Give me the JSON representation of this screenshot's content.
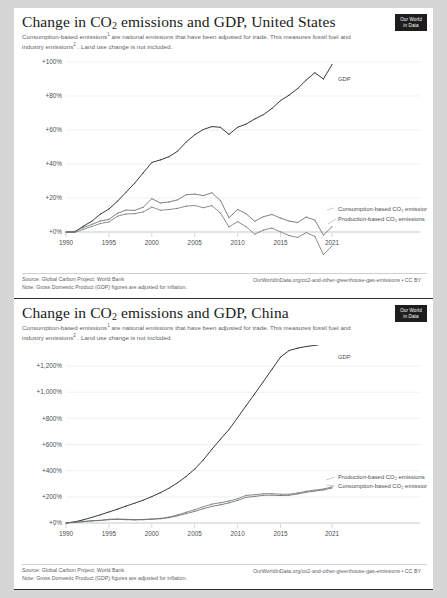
{
  "page": {
    "background_color": "#d6d6d6",
    "card_color": "#ffffff"
  },
  "logo": {
    "line1": "Our World",
    "line2": "in Data"
  },
  "shared": {
    "subtitle_part1": "Consumption-based emissions",
    "subtitle_sup1": "1",
    "subtitle_part2": " are national emissions that have been adjusted for trade. This measures fossil fuel and industry emissions",
    "subtitle_sup2": "2",
    "subtitle_part3": " . Land use change is not included.",
    "source": "Source: Global Carbon Project; World Bank",
    "note": "Note: Gross Domestic Product (GDP) figures are adjusted for inflation.",
    "attribution": "OurWorldInData.org/co2-and-other-greenhouse-gas-emissions • CC BY"
  },
  "charts": [
    {
      "id": "united-states",
      "title_prefix": "Change in CO",
      "title_sub": "2",
      "title_suffix": " emissions and GDP, United States",
      "gdp_label": "GDP",
      "label_consumption": "Consumption-based CO₂ emissions",
      "label_production": "Production-based CO₂ emissions"
    },
    {
      "id": "china",
      "title_prefix": "Change in CO",
      "title_sub": "2",
      "title_suffix": " emissions and GDP, China",
      "gdp_label": "GDP",
      "label_consumption": "Consumption-based CO₂ emissions",
      "label_production": "Production-based CO₂ emissions"
    }
  ],
  "chart_data": [
    {
      "type": "line",
      "title": "Change in CO2 emissions and GDP, United States",
      "xlabel": "",
      "ylabel": "",
      "xlim": [
        1990,
        2021
      ],
      "ylim": [
        0,
        100
      ],
      "grid": true,
      "xticks": [
        1990,
        1995,
        2000,
        2005,
        2010,
        2015,
        2021
      ],
      "yticks": [
        0,
        20,
        40,
        60,
        80,
        100
      ],
      "ytick_labels": [
        "+0%",
        "+20%",
        "+40%",
        "+60%",
        "+80%",
        "+100%"
      ],
      "legend_position": "right-inline",
      "x": [
        1990,
        1991,
        1992,
        1993,
        1994,
        1995,
        1996,
        1997,
        1998,
        1999,
        2000,
        2001,
        2002,
        2003,
        2004,
        2005,
        2006,
        2007,
        2008,
        2009,
        2010,
        2011,
        2012,
        2013,
        2014,
        2015,
        2016,
        2017,
        2018,
        2019,
        2020,
        2021
      ],
      "series": [
        {
          "name": "GDP",
          "values": [
            0,
            -0.1,
            3.4,
            6.3,
            10.5,
            13.5,
            18.1,
            23.4,
            28.7,
            34.8,
            40.9,
            42.4,
            44.3,
            47.5,
            52.9,
            57.2,
            60.3,
            62.0,
            61.6,
            57.4,
            61.6,
            63.5,
            66.5,
            69.0,
            72.7,
            77.3,
            80.5,
            84.4,
            89.4,
            93.7,
            90.0,
            98.5
          ]
        },
        {
          "name": "Consumption-based CO2 emissions",
          "values": [
            0,
            0.4,
            2.6,
            4.4,
            6.5,
            7.4,
            11.0,
            12.9,
            12.7,
            14.6,
            19.6,
            17.1,
            17.7,
            18.9,
            21.9,
            22.3,
            21.4,
            23.1,
            18.5,
            8.4,
            13.3,
            10.7,
            6.3,
            9.0,
            10.3,
            8.2,
            6.4,
            5.6,
            8.8,
            7.0,
            -1.8,
            3.1
          ]
        },
        {
          "name": "Production-based CO2 emissions",
          "values": [
            0,
            -0.3,
            1.5,
            3.2,
            5.0,
            5.9,
            9.3,
            10.6,
            10.8,
            11.8,
            14.7,
            12.8,
            13.2,
            13.9,
            15.2,
            15.6,
            14.3,
            15.5,
            11.2,
            3.0,
            6.1,
            3.1,
            -1.3,
            1.1,
            2.3,
            0.1,
            -2.1,
            -3.2,
            -0.3,
            -2.6,
            -13.3,
            -8.2
          ]
        }
      ]
    },
    {
      "type": "line",
      "title": "Change in CO2 emissions and GDP, China",
      "xlabel": "",
      "ylabel": "",
      "xlim": [
        1990,
        2021
      ],
      "ylim": [
        0,
        1300
      ],
      "grid": true,
      "xticks": [
        1990,
        1995,
        2000,
        2005,
        2010,
        2015,
        2021
      ],
      "yticks": [
        0,
        200,
        400,
        600,
        800,
        1000,
        1200
      ],
      "ytick_labels": [
        "+0%",
        "+200%",
        "+400%",
        "+600%",
        "+800%",
        "+1,000%",
        "+1,200%"
      ],
      "legend_position": "right-inline",
      "x": [
        1990,
        1991,
        1992,
        1993,
        1994,
        1995,
        1996,
        1997,
        1998,
        1999,
        2000,
        2001,
        2002,
        2003,
        2004,
        2005,
        2006,
        2007,
        2008,
        2009,
        2010,
        2011,
        2012,
        2013,
        2014,
        2015,
        2016,
        2017,
        2018,
        2019,
        2020,
        2021
      ],
      "series": [
        {
          "name": "GDP",
          "values": [
            0,
            9.2,
            24.0,
            42.5,
            62.7,
            84.3,
            105.8,
            129.3,
            151.5,
            174.5,
            201.8,
            232.0,
            266.3,
            307.7,
            356.0,
            412.4,
            481.9,
            563.4,
            640.6,
            714.9,
            805.9,
            898.4,
            988.3,
            1081.2,
            1175.0,
            1268.4,
            1319.0,
            1337.0,
            1350.0,
            1358.0,
            1370.0,
            1380.0
          ]
        },
        {
          "name": "Production-based CO2 emissions",
          "values": [
            0,
            5.5,
            11.0,
            17.5,
            21.0,
            28.5,
            31.0,
            28.5,
            26.0,
            27.5,
            31.0,
            35.5,
            45.0,
            62.0,
            82.0,
            102.0,
            124.0,
            144.0,
            155.0,
            168.0,
            186.0,
            211.0,
            216.0,
            224.0,
            224.0,
            220.0,
            220.0,
            230.0,
            243.0,
            252.0,
            260.0,
            276.0
          ]
        },
        {
          "name": "Consumption-based CO2 emissions",
          "values": [
            0,
            5.0,
            10.0,
            16.0,
            19.0,
            25.5,
            28.0,
            25.5,
            23.5,
            25.0,
            28.0,
            32.5,
            41.0,
            55.0,
            72.0,
            89.0,
            109.0,
            127.0,
            139.0,
            154.0,
            173.0,
            196.0,
            203.0,
            212.0,
            213.0,
            210.0,
            212.0,
            222.0,
            235.0,
            244.0,
            253.0,
            268.0
          ]
        }
      ]
    }
  ]
}
